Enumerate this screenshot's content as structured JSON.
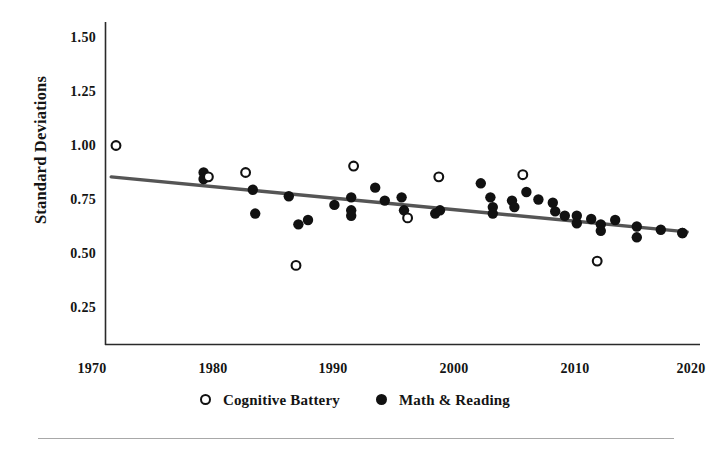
{
  "chart_data": {
    "type": "scatter",
    "title": "",
    "subtitle": "",
    "xlabel": "",
    "ylabel": "Standard Deviations",
    "xlim": [
      1968,
      2021
    ],
    "ylim": [
      0.13,
      1.62
    ],
    "grid": false,
    "legend_position": "bottom",
    "x_ticks": [
      "1970",
      "1980",
      "1990",
      "2000",
      "2010",
      "2020"
    ],
    "x_tick_values": [
      1970,
      1980,
      1990,
      2000,
      2010,
      2020
    ],
    "y_ticks": [
      "0.25",
      "0.50",
      "0.75",
      "1.00",
      "1.25",
      "1.50"
    ],
    "y_tick_values": [
      0.25,
      0.5,
      0.75,
      1.0,
      1.25,
      1.5
    ],
    "series": [
      {
        "name": "Cognitive Battery",
        "marker": "open-circle",
        "color": "#111111",
        "points": [
          [
            1972,
            1.03
          ],
          [
            1979.7,
            0.885
          ],
          [
            1982.8,
            0.905
          ],
          [
            1987.0,
            0.475
          ],
          [
            1991.8,
            0.935
          ],
          [
            1996.3,
            0.695
          ],
          [
            1998.9,
            0.885
          ],
          [
            2005.9,
            0.895
          ],
          [
            2012.1,
            0.495
          ]
        ]
      },
      {
        "name": "Math & Reading",
        "marker": "filled-circle",
        "color": "#111111",
        "points": [
          [
            1979.3,
            0.905
          ],
          [
            1979.3,
            0.875
          ],
          [
            1983.4,
            0.825
          ],
          [
            1983.6,
            0.715
          ],
          [
            1986.4,
            0.795
          ],
          [
            1987.2,
            0.665
          ],
          [
            1988.0,
            0.685
          ],
          [
            1990.2,
            0.755
          ],
          [
            1991.6,
            0.79
          ],
          [
            1991.6,
            0.73
          ],
          [
            1991.6,
            0.705
          ],
          [
            1993.6,
            0.835
          ],
          [
            1994.4,
            0.775
          ],
          [
            1995.8,
            0.79
          ],
          [
            1996.0,
            0.73
          ],
          [
            1998.6,
            0.715
          ],
          [
            1999.0,
            0.73
          ],
          [
            2002.4,
            0.855
          ],
          [
            2003.2,
            0.79
          ],
          [
            2003.4,
            0.745
          ],
          [
            2003.4,
            0.715
          ],
          [
            2005.0,
            0.775
          ],
          [
            2005.2,
            0.745
          ],
          [
            2006.2,
            0.815
          ],
          [
            2007.2,
            0.78
          ],
          [
            2008.4,
            0.765
          ],
          [
            2008.6,
            0.725
          ],
          [
            2009.4,
            0.705
          ],
          [
            2010.4,
            0.705
          ],
          [
            2010.4,
            0.67
          ],
          [
            2011.6,
            0.69
          ],
          [
            2012.4,
            0.665
          ],
          [
            2012.4,
            0.635
          ],
          [
            2013.6,
            0.685
          ],
          [
            2015.4,
            0.655
          ],
          [
            2015.4,
            0.605
          ],
          [
            2017.4,
            0.64
          ],
          [
            2019.2,
            0.625
          ],
          [
            2019.2,
            0.625
          ]
        ]
      }
    ],
    "trendline": {
      "name": "linear-fit",
      "color": "#555555",
      "x_start": 1971.6,
      "y_start": 0.885,
      "x_end": 2019.6,
      "y_end": 0.63
    },
    "annotations": []
  },
  "legend": {
    "items": [
      {
        "label": "Cognitive Battery",
        "marker": "open-circle"
      },
      {
        "label": "Math & Reading",
        "marker": "filled-circle"
      }
    ]
  }
}
